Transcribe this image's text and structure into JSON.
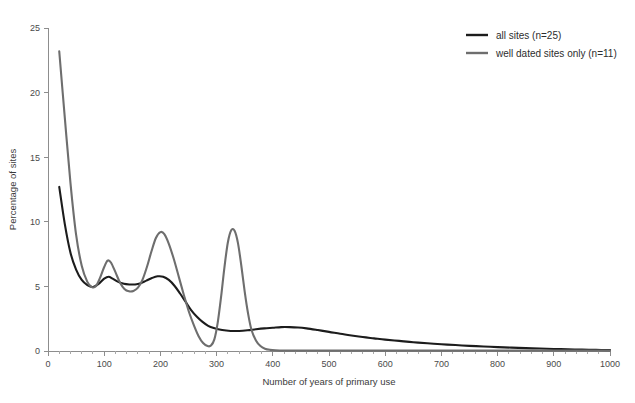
{
  "chart_data": {
    "type": "line",
    "title": "",
    "xlabel": "Number of years of primary use",
    "ylabel": "Percentage of sites",
    "xlim": [
      0,
      1000
    ],
    "ylim": [
      0,
      25
    ],
    "xticks": [
      0,
      100,
      200,
      300,
      400,
      500,
      600,
      700,
      800,
      900,
      1000
    ],
    "yticks": [
      0,
      5,
      10,
      15,
      20,
      25
    ],
    "xtick_labels": [
      "0",
      "100",
      "200",
      "300",
      "400",
      "500",
      "600",
      "700",
      "800",
      "900",
      "1000"
    ],
    "ytick_labels": [
      "0",
      "5",
      "10",
      "15",
      "20",
      "25"
    ],
    "x_minor_step": 20,
    "grid": false,
    "legend_position": "top-right",
    "series": [
      {
        "name": "all sites (n=25)",
        "color": "#1c1c1c",
        "width": 2.1,
        "points": [
          [
            20,
            12.7
          ],
          [
            30,
            9.8
          ],
          [
            40,
            7.6
          ],
          [
            50,
            6.3
          ],
          [
            60,
            5.5
          ],
          [
            70,
            5.1
          ],
          [
            80,
            4.95
          ],
          [
            90,
            5.2
          ],
          [
            100,
            5.6
          ],
          [
            108,
            5.75
          ],
          [
            115,
            5.6
          ],
          [
            125,
            5.35
          ],
          [
            135,
            5.2
          ],
          [
            145,
            5.15
          ],
          [
            155,
            5.15
          ],
          [
            165,
            5.25
          ],
          [
            175,
            5.45
          ],
          [
            185,
            5.65
          ],
          [
            195,
            5.78
          ],
          [
            205,
            5.75
          ],
          [
            215,
            5.5
          ],
          [
            225,
            5.05
          ],
          [
            235,
            4.45
          ],
          [
            245,
            3.8
          ],
          [
            255,
            3.15
          ],
          [
            265,
            2.65
          ],
          [
            275,
            2.25
          ],
          [
            285,
            1.95
          ],
          [
            295,
            1.78
          ],
          [
            310,
            1.62
          ],
          [
            325,
            1.55
          ],
          [
            340,
            1.55
          ],
          [
            355,
            1.6
          ],
          [
            370,
            1.68
          ],
          [
            385,
            1.75
          ],
          [
            400,
            1.8
          ],
          [
            415,
            1.85
          ],
          [
            430,
            1.85
          ],
          [
            445,
            1.82
          ],
          [
            460,
            1.75
          ],
          [
            480,
            1.62
          ],
          [
            500,
            1.48
          ],
          [
            520,
            1.33
          ],
          [
            540,
            1.2
          ],
          [
            560,
            1.08
          ],
          [
            580,
            0.98
          ],
          [
            600,
            0.88
          ],
          [
            625,
            0.78
          ],
          [
            650,
            0.68
          ],
          [
            675,
            0.6
          ],
          [
            700,
            0.52
          ],
          [
            725,
            0.46
          ],
          [
            750,
            0.4
          ],
          [
            775,
            0.35
          ],
          [
            800,
            0.3
          ],
          [
            825,
            0.26
          ],
          [
            850,
            0.22
          ],
          [
            875,
            0.19
          ],
          [
            900,
            0.16
          ],
          [
            925,
            0.13
          ],
          [
            950,
            0.11
          ],
          [
            975,
            0.09
          ],
          [
            1000,
            0.07
          ]
        ]
      },
      {
        "name": "well dated sites only (n=11)",
        "color": "#6e6e6e",
        "width": 2.1,
        "points": [
          [
            20,
            23.2
          ],
          [
            30,
            18.0
          ],
          [
            40,
            13.0
          ],
          [
            50,
            9.0
          ],
          [
            60,
            6.6
          ],
          [
            70,
            5.35
          ],
          [
            78,
            4.95
          ],
          [
            85,
            5.0
          ],
          [
            92,
            5.6
          ],
          [
            100,
            6.5
          ],
          [
            106,
            7.0
          ],
          [
            112,
            6.85
          ],
          [
            120,
            6.1
          ],
          [
            128,
            5.3
          ],
          [
            136,
            4.8
          ],
          [
            144,
            4.62
          ],
          [
            152,
            4.65
          ],
          [
            160,
            4.9
          ],
          [
            168,
            5.5
          ],
          [
            176,
            6.5
          ],
          [
            184,
            7.7
          ],
          [
            192,
            8.75
          ],
          [
            200,
            9.2
          ],
          [
            207,
            9.05
          ],
          [
            215,
            8.3
          ],
          [
            224,
            7.1
          ],
          [
            233,
            5.7
          ],
          [
            242,
            4.3
          ],
          [
            251,
            3.0
          ],
          [
            260,
            1.95
          ],
          [
            268,
            1.15
          ],
          [
            276,
            0.62
          ],
          [
            284,
            0.38
          ],
          [
            290,
            0.42
          ],
          [
            296,
            0.9
          ],
          [
            302,
            2.2
          ],
          [
            308,
            4.2
          ],
          [
            314,
            6.5
          ],
          [
            320,
            8.4
          ],
          [
            326,
            9.35
          ],
          [
            332,
            9.3
          ],
          [
            338,
            8.35
          ],
          [
            344,
            6.6
          ],
          [
            350,
            4.6
          ],
          [
            356,
            2.9
          ],
          [
            362,
            1.65
          ],
          [
            370,
            0.82
          ],
          [
            378,
            0.38
          ],
          [
            386,
            0.18
          ],
          [
            395,
            0.09
          ],
          [
            405,
            0.05
          ],
          [
            420,
            0.03
          ],
          [
            450,
            0.03
          ],
          [
            500,
            0.03
          ],
          [
            560,
            0.03
          ],
          [
            620,
            0.03
          ],
          [
            700,
            0.03
          ],
          [
            800,
            0.03
          ],
          [
            900,
            0.03
          ],
          [
            1000,
            0.03
          ]
        ]
      }
    ]
  },
  "legend": {
    "entries": [
      {
        "label": "all sites (n=25)",
        "color": "#1c1c1c"
      },
      {
        "label": "well dated sites only (n=11)",
        "color": "#6e6e6e"
      }
    ]
  }
}
